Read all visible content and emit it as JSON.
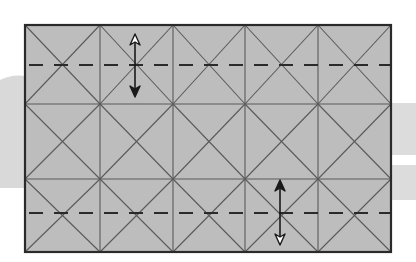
{
  "diagram": {
    "type": "origami-crease-pattern",
    "colors": {
      "background": "#ffffff",
      "backdrop_band": "#d9d9d9",
      "paper_fill": "#bdbdbd",
      "frame": "#2a2a2a",
      "crease": "#5a5a5a",
      "valley_fold": "#2a2a2a",
      "arrow": "#1a1a1a",
      "arrow_hollow_fill": "#ffffff"
    },
    "paper": {
      "x": 25,
      "y": 25,
      "width": 366,
      "height": 227
    },
    "grid": {
      "columns": 5,
      "rows": 3,
      "diagonals_per_cell": "X"
    },
    "column_lines_x": [
      100,
      173,
      245,
      318
    ],
    "row_lines_y": [
      104,
      179
    ],
    "valley_folds": [
      {
        "name": "top-valley-fold",
        "y": 65
      },
      {
        "name": "bottom-valley-fold",
        "y": 213
      }
    ],
    "arrows": [
      {
        "name": "top-fold-arrow",
        "x": 135,
        "y_hollow": 34,
        "y_filled": 97,
        "hollow_end": "top",
        "filled_end": "bottom"
      },
      {
        "name": "bottom-fold-arrow",
        "x": 280,
        "y_filled": 180,
        "y_hollow": 245,
        "filled_end": "top",
        "hollow_end": "bottom"
      }
    ]
  }
}
